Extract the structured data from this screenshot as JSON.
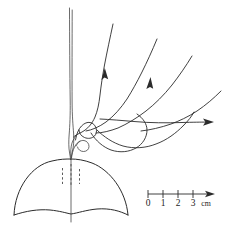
{
  "figure": {
    "background_color": "#ffffff",
    "ink_color": "#2b2b2b",
    "width": 230,
    "height": 226
  },
  "scale_bar": {
    "name": "centimeter-scale-bar",
    "unit_label": "cm",
    "ticks": [
      {
        "label": "0",
        "value": 0,
        "x": 148
      },
      {
        "label": "1",
        "value": 1,
        "x": 163
      },
      {
        "label": "2",
        "value": 2,
        "x": 178
      },
      {
        "label": "3",
        "value": 3,
        "x": 193
      }
    ],
    "axis_y": 194,
    "axis_x_start": 148,
    "axis_x_end": 213,
    "tick_height": 5,
    "label_y": 205,
    "unit_x": 205,
    "unit_y": 205
  },
  "dome": {
    "name": "hemispherical-dome",
    "apex_x": 71,
    "apex_y": 160,
    "left_x": 14,
    "right_x": 128,
    "base_y": 215,
    "center_line": {
      "x": 71,
      "y_top": 160,
      "y_bottom": 222
    },
    "dashed_lines": [
      {
        "x": 62,
        "y_top": 167,
        "y_bottom": 184
      },
      {
        "x": 71,
        "y_top": 164,
        "y_bottom": 186
      },
      {
        "x": 80,
        "y_top": 168,
        "y_bottom": 184
      }
    ]
  },
  "jet": {
    "name": "vertical-jet",
    "top_y": 8,
    "bottom_y": 158,
    "x": 71
  },
  "filaments": [
    {
      "name": "filament-left-jet",
      "has_arrow": false,
      "arrow_direction": "up"
    },
    {
      "name": "filament-inner-arrowed",
      "has_arrow": true,
      "arrow_direction": "up"
    },
    {
      "name": "filament-middle-arrowed",
      "has_arrow": true,
      "arrow_direction": "up"
    },
    {
      "name": "filament-outer-right",
      "has_arrow": false,
      "arrow_direction": "up-right"
    },
    {
      "name": "filament-horizontal-arrowed",
      "has_arrow": true,
      "arrow_direction": "right"
    },
    {
      "name": "filament-loop-lower",
      "has_arrow": false,
      "arrow_direction": "none"
    },
    {
      "name": "filament-loop-small-apex",
      "has_arrow": false,
      "arrow_direction": "none"
    }
  ],
  "arrows": [
    {
      "name": "arrow-up-inner",
      "x": 106,
      "y": 80,
      "direction": "up"
    },
    {
      "name": "arrow-up-middle",
      "x": 152,
      "y": 89,
      "direction": "up"
    },
    {
      "name": "arrow-right-horizontal",
      "x": 210,
      "y": 122,
      "direction": "right"
    },
    {
      "name": "arrow-scale-bar",
      "x": 213,
      "y": 194,
      "direction": "right"
    }
  ]
}
